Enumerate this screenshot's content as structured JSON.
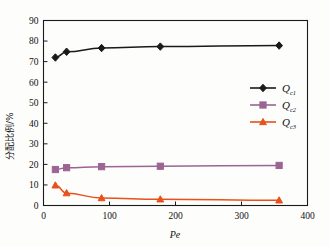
{
  "chart_data": {
    "type": "line",
    "title": "",
    "xlabel": "Pe",
    "ylabel": "分配比例/%",
    "xlim": [
      0,
      400
    ],
    "ylim": [
      0,
      90
    ],
    "x_ticks": [
      0,
      100,
      200,
      300,
      400
    ],
    "y_ticks": [
      0,
      10,
      20,
      30,
      40,
      50,
      60,
      70,
      80,
      90
    ],
    "grid": false,
    "legend_position": "right-middle",
    "x": [
      18,
      35,
      88,
      177,
      357
    ],
    "series": [
      {
        "name": "Qc1",
        "label_main": "Q",
        "label_sub": "c1",
        "color": "#1a1a1a",
        "marker": "diamond",
        "values": [
          72.0,
          74.8,
          76.6,
          77.3,
          77.8
        ]
      },
      {
        "name": "Qc2",
        "label_main": "Q",
        "label_sub": "c2",
        "color": "#9c6492",
        "marker": "square",
        "values": [
          17.5,
          18.4,
          18.9,
          19.1,
          19.5
        ]
      },
      {
        "name": "Qc3",
        "label_main": "Q",
        "label_sub": "c3",
        "color": "#e8511b",
        "marker": "triangle",
        "values": [
          9.8,
          6.0,
          3.6,
          3.0,
          2.5
        ]
      }
    ]
  },
  "axes": {
    "x_tick_labels": [
      "0",
      "100",
      "200",
      "300",
      "400"
    ],
    "y_tick_labels": [
      "0",
      "10",
      "20",
      "30",
      "40",
      "50",
      "60",
      "70",
      "80",
      "90"
    ],
    "x_axis_title": "Pe",
    "y_axis_title": "分配比例/%"
  },
  "legend": {
    "items": [
      {
        "main": "Q",
        "sub": "c1",
        "color": "#1a1a1a"
      },
      {
        "main": "Q",
        "sub": "c2",
        "color": "#9c6492"
      },
      {
        "main": "Q",
        "sub": "c3",
        "color": "#e8511b"
      }
    ]
  }
}
